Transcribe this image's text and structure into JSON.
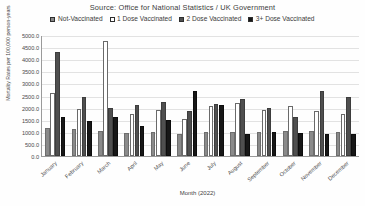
{
  "title": "Source: Office for National Statistics / UK Government",
  "legend": {
    "position": "top",
    "items": [
      {
        "label": "Not-Vaccinated",
        "swatch": "dark-gray-hatch-swatch",
        "color": "#8a8a8a"
      },
      {
        "label": "1 Dose Vaccinated",
        "swatch": "white-swatch",
        "color": "#ffffff"
      },
      {
        "label": "2 Dose Vaccinated",
        "swatch": "mid-gray-swatch",
        "color": "#4f4f4f"
      },
      {
        "label": "3+ Dose Vaccinated",
        "swatch": "black-swatch",
        "color": "#171717"
      }
    ]
  },
  "axes": {
    "y_title": "Mortality Rates per 100,000 person-years",
    "x_title": "Month (2022)",
    "y_ticks": [
      "5000.0",
      "4500.0",
      "4000.0",
      "3500.0",
      "3000.0",
      "2500.0",
      "2000.0",
      "1500.0",
      "1000.0",
      "500.0",
      "0.0"
    ]
  },
  "chart_data": {
    "type": "bar",
    "title": "Source: Office for National Statistics / UK Government",
    "xlabel": "Month (2022)",
    "ylabel": "Mortality Rates per 100,000 person-years",
    "ylim": [
      0,
      5000
    ],
    "ytick_step": 500,
    "grid": true,
    "legend_position": "top",
    "categories": [
      "January",
      "February",
      "March",
      "April",
      "May",
      "June",
      "July",
      "August",
      "September",
      "October",
      "November",
      "December"
    ],
    "series": [
      {
        "name": "Not-Vaccinated",
        "color": "#8a8a8a",
        "values": [
          1150,
          1100,
          1050,
          950,
          1000,
          900,
          980,
          1000,
          1000,
          1050,
          1050,
          1000
        ]
      },
      {
        "name": "1 Dose Vaccinated",
        "color": "#ffffff",
        "values": [
          2600,
          1950,
          4750,
          1750,
          1900,
          1550,
          2050,
          2200,
          1900,
          2050,
          1850,
          1750
        ]
      },
      {
        "name": "2 Dose Vaccinated",
        "color": "#4f4f4f",
        "values": [
          4300,
          2450,
          2000,
          2100,
          2250,
          1850,
          2150,
          2350,
          2000,
          1600,
          2700,
          2450
        ]
      },
      {
        "name": "3+ Dose Vaccinated",
        "color": "#171717",
        "values": [
          1600,
          1450,
          1600,
          1250,
          1500,
          2700,
          2100,
          900,
          1000,
          950,
          900,
          900
        ]
      }
    ]
  }
}
